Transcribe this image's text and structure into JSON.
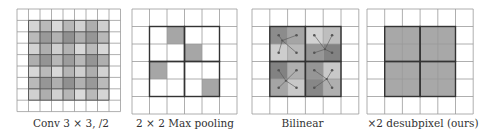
{
  "figure": {
    "panels": [
      {
        "id": "conv",
        "caption": "Conv 3 × 3, /2",
        "grid": {
          "cols": 9,
          "rows": 9
        },
        "shaded_region": {
          "col_start": 1,
          "row_start": 1,
          "cols": 7,
          "rows": 7
        },
        "description": "overlapping 3x3 strided convolution windows produce uneven gray shading"
      },
      {
        "id": "maxpool",
        "caption": "2 × 2 Max pooling",
        "grid": {
          "cols": 6,
          "rows": 6
        },
        "bold_region": {
          "col_start": 1,
          "row_start": 1,
          "cols": 4,
          "rows": 4,
          "block": 2
        },
        "selected_cells": [
          [
            1,
            2
          ],
          [
            2,
            3
          ],
          [
            3,
            1
          ],
          [
            4,
            4
          ]
        ]
      },
      {
        "id": "bilinear",
        "caption": "Bilinear",
        "grid": {
          "cols": 6,
          "rows": 6
        },
        "bold_region": {
          "col_start": 1,
          "row_start": 1,
          "cols": 4,
          "rows": 4,
          "block": 2
        }
      },
      {
        "id": "desubpixel",
        "caption": "×2 desubpixel (ours)",
        "grid": {
          "cols": 6,
          "rows": 6
        },
        "bold_region": {
          "col_start": 1,
          "row_start": 1,
          "cols": 4,
          "rows": 4,
          "block": 2
        }
      }
    ],
    "colors": {
      "grid_line": "#9a9a9a",
      "bold_line": "#333333",
      "maxpool_fill": "#a6a6a6",
      "desubpixel_fill": "#a8a8a8",
      "dot": "#555555"
    }
  }
}
